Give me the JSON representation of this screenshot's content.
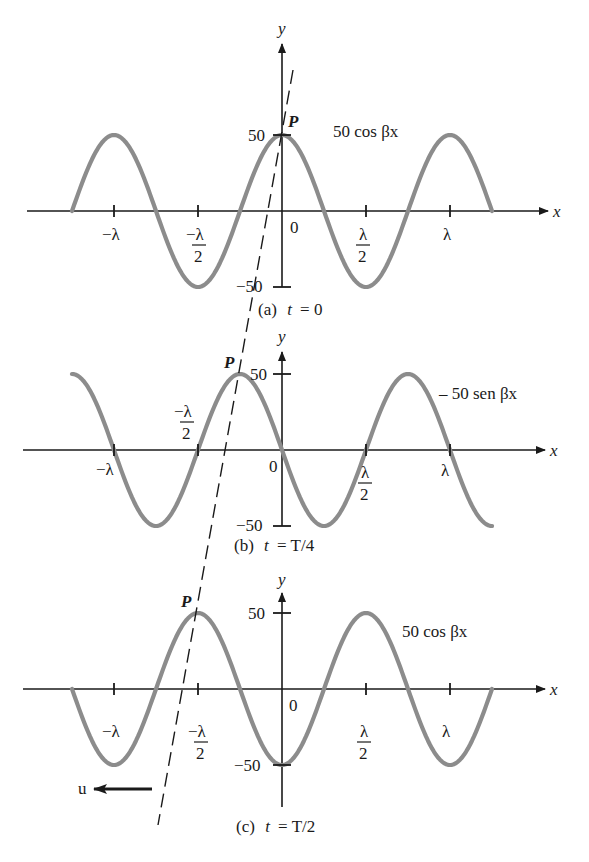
{
  "figure": {
    "wave_color": "#8c8c8c",
    "axis_color": "#1a1a1a",
    "dashed_line": {
      "from": [
        293,
        70
      ],
      "to": [
        158,
        825
      ],
      "meaning": "trajectory of point P (constant phase) moving left"
    },
    "velocity_label": "u",
    "panels": [
      {
        "id": "a",
        "caption_prefix": "(a)",
        "caption_t": "t",
        "caption_eq": "= 0",
        "function_label": "50 cos βx",
        "y_axis_label": "y",
        "x_axis_label": "x",
        "y_tick_top": "50",
        "y_tick_bottom": "−50",
        "origin_label": "0",
        "point_label": "P",
        "x_ticks": [
          "−λ",
          "−λ/2",
          "λ/2",
          "λ"
        ]
      },
      {
        "id": "b",
        "caption_prefix": "(b)",
        "caption_t": "t",
        "caption_eq": "= T/4",
        "function_label": "– 50 sen βx",
        "y_axis_label": "y",
        "x_axis_label": "x",
        "y_tick_top": "50",
        "y_tick_bottom": "−50",
        "origin_label": "0",
        "point_label": "P",
        "x_ticks": [
          "−λ",
          "−λ/2",
          "λ/2",
          "λ"
        ]
      },
      {
        "id": "c",
        "caption_prefix": "(c)",
        "caption_t": "t",
        "caption_eq": "= T/2",
        "function_label": "50 cos βx",
        "y_axis_label": "y",
        "x_axis_label": "x",
        "y_tick_top": "50",
        "y_tick_bottom": "−50",
        "origin_label": "0",
        "point_label": "P",
        "x_ticks": [
          "−λ",
          "−λ/2",
          "λ/2",
          "λ"
        ]
      }
    ]
  },
  "chart_data": [
    {
      "type": "line",
      "title": "(a) t = 0",
      "series": [
        {
          "name": "50 cos βx",
          "x": [
            -1.25,
            -1,
            -0.75,
            -0.5,
            -0.25,
            0,
            0.25,
            0.5,
            0.75,
            1,
            1.25
          ],
          "values": [
            0,
            50,
            0,
            -50,
            0,
            50,
            0,
            -50,
            0,
            50,
            0
          ]
        }
      ],
      "xlabel": "x (in units of λ)",
      "ylabel": "y",
      "x_tick_labels": [
        "−λ",
        "−λ/2",
        "0",
        "λ/2",
        "λ"
      ],
      "y_tick_labels": [
        "50",
        "−50"
      ],
      "ylim": [
        -50,
        50
      ],
      "annotations": [
        "P at (0, 50)"
      ]
    },
    {
      "type": "line",
      "title": "(b) t = T/4",
      "series": [
        {
          "name": "– 50 sen βx",
          "x": [
            -1.25,
            -1,
            -0.75,
            -0.5,
            -0.25,
            0,
            0.25,
            0.5,
            0.75,
            1,
            1.25
          ],
          "values": [
            50,
            0,
            -50,
            0,
            50,
            0,
            -50,
            0,
            50,
            0,
            -50
          ]
        }
      ],
      "xlabel": "x (in units of λ)",
      "ylabel": "y",
      "x_tick_labels": [
        "−λ",
        "−λ/2",
        "0",
        "λ/2",
        "λ"
      ],
      "y_tick_labels": [
        "50",
        "−50"
      ],
      "ylim": [
        -50,
        50
      ],
      "annotations": [
        "P at (−λ/4, 50)"
      ]
    },
    {
      "type": "line",
      "title": "(c) t = T/2",
      "series": [
        {
          "name": "50 cos βx",
          "x": [
            -1.25,
            -1,
            -0.75,
            -0.5,
            -0.25,
            0,
            0.25,
            0.5,
            0.75,
            1,
            1.25
          ],
          "values": [
            0,
            -50,
            0,
            50,
            0,
            -50,
            0,
            50,
            0,
            -50,
            0
          ]
        }
      ],
      "xlabel": "x (in units of λ)",
      "ylabel": "y",
      "x_tick_labels": [
        "−λ",
        "−λ/2",
        "0",
        "λ/2",
        "λ"
      ],
      "y_tick_labels": [
        "50",
        "−50"
      ],
      "ylim": [
        -50,
        50
      ],
      "annotations": [
        "P at (−λ/2, 50)",
        "u ← wave travels in −x direction"
      ]
    }
  ]
}
